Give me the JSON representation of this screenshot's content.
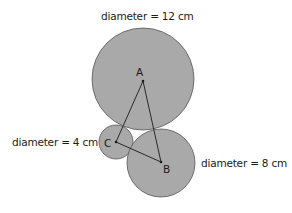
{
  "diagram": {
    "labels": {
      "large": "diameter = 12 cm",
      "small": "diameter = 4 cm",
      "medium": "diameter = 8 cm"
    },
    "points": {
      "A": "A",
      "B": "B",
      "C": "C"
    },
    "circles": [
      {
        "name": "large",
        "center_point": "A",
        "diameter_cm": 12,
        "cx": 143,
        "cy": 79,
        "r": 51
      },
      {
        "name": "small",
        "center_point": "C",
        "diameter_cm": 4,
        "cx": 116,
        "cy": 142,
        "r": 17
      },
      {
        "name": "medium",
        "center_point": "B",
        "diameter_cm": 8,
        "cx": 161,
        "cy": 163,
        "r": 34
      }
    ],
    "triangle": [
      "A",
      "B",
      "C"
    ],
    "colors": {
      "circle_fill": "#a9a9a9",
      "circle_stroke": "#555555",
      "line": "#1a1a1a"
    }
  }
}
